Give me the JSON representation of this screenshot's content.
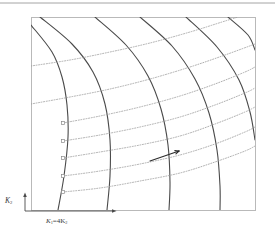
{
  "figure": {
    "type": "contour-field-diagram",
    "background": "#ffffff",
    "scan_artifact": {
      "name": "top-scan-line",
      "color": "#8a8a8a",
      "y": 3
    },
    "plot_frame": {
      "x": 31,
      "y": 17,
      "width": 224,
      "height": 193,
      "stroke": "#b9b9b9",
      "stroke_width": 1
    },
    "axes": {
      "origin": {
        "x": 25,
        "y": 211
      },
      "y_axis": {
        "label_main": "K",
        "label_sub": "2",
        "x": 25,
        "y_top": 196,
        "y_bottom": 211,
        "arrow": "up"
      },
      "x_axis": {
        "label_main": "K",
        "label_sub": "1",
        "label_rest": "=4K",
        "label_rest_sub": "2",
        "y": 228,
        "x_left": 25,
        "x_right": 113,
        "arrow": "right"
      }
    },
    "curve_families": [
      {
        "name": "primary-contours",
        "style": "solid",
        "color": "#4a4a4a",
        "stroke_width": 1.1,
        "count": 6,
        "description": "steep descending curves sweeping from upper-left to lower-right"
      },
      {
        "name": "trajectory-curves",
        "style": "dotted",
        "color": "#9a9a9a",
        "stroke_width": 0.8,
        "count": 5,
        "description": "light dotted curves rising gently to the right from square start markers"
      }
    ],
    "markers": {
      "name": "start-point-marker",
      "shape": "square",
      "size": 3,
      "fill": "#ffffff",
      "stroke": "#8a8a8a",
      "points": [
        {
          "x": 63,
          "y": 123
        },
        {
          "x": 63,
          "y": 141
        },
        {
          "x": 63,
          "y": 158
        },
        {
          "x": 63,
          "y": 176
        },
        {
          "x": 63,
          "y": 192
        }
      ]
    },
    "annotation_arrow": {
      "name": "direction-arrow",
      "x1": 150,
      "y1": 161,
      "x2": 179,
      "y2": 151,
      "color": "#2b2b2b",
      "stroke_width": 1.1
    }
  },
  "chart_data": {
    "type": "line",
    "title": "",
    "xlabel": "K1 = 4K2",
    "ylabel": "K2",
    "grid": false,
    "legend": null,
    "axis_note": "unlabeled axes; arrows indicate increasing direction",
    "series": [
      {
        "name": "contour-1",
        "style": "solid",
        "color": "#4a4a4a",
        "points": [
          [
            31,
            25
          ],
          [
            52,
            52
          ],
          [
            62,
            77
          ],
          [
            67,
            105
          ],
          [
            68,
            137
          ],
          [
            64,
            176
          ],
          [
            58,
            210
          ]
        ]
      },
      {
        "name": "contour-2",
        "style": "solid",
        "color": "#4a4a4a",
        "points": [
          [
            40,
            17
          ],
          [
            72,
            44
          ],
          [
            93,
            72
          ],
          [
            105,
            104
          ],
          [
            110,
            140
          ],
          [
            110,
            176
          ],
          [
            107,
            210
          ]
        ]
      },
      {
        "name": "contour-3",
        "style": "solid",
        "color": "#4a4a4a",
        "points": [
          [
            95,
            17
          ],
          [
            126,
            45
          ],
          [
            148,
            76
          ],
          [
            161,
            109
          ],
          [
            168,
            145
          ],
          [
            170,
            182
          ],
          [
            169,
            210
          ]
        ]
      },
      {
        "name": "contour-4",
        "style": "solid",
        "color": "#4a4a4a",
        "points": [
          [
            140,
            17
          ],
          [
            172,
            46
          ],
          [
            195,
            79
          ],
          [
            209,
            113
          ],
          [
            217,
            150
          ],
          [
            220,
            186
          ],
          [
            220,
            210
          ]
        ]
      },
      {
        "name": "contour-5",
        "style": "solid",
        "color": "#4a4a4a",
        "points": [
          [
            186,
            17
          ],
          [
            217,
            47
          ],
          [
            239,
            80
          ],
          [
            250,
            112
          ],
          [
            255,
            140
          ]
        ]
      },
      {
        "name": "contour-6",
        "style": "solid",
        "color": "#4a4a4a",
        "points": [
          [
            228,
            17
          ],
          [
            248,
            35
          ],
          [
            255,
            50
          ]
        ]
      },
      {
        "name": "trajectory-1",
        "style": "dotted",
        "color": "#9a9a9a",
        "points": [
          [
            63,
            123
          ],
          [
            100,
            116
          ],
          [
            140,
            107
          ],
          [
            180,
            96
          ],
          [
            215,
            84
          ],
          [
            245,
            72
          ],
          [
            255,
            67
          ]
        ]
      },
      {
        "name": "trajectory-2",
        "style": "dotted",
        "color": "#9a9a9a",
        "points": [
          [
            63,
            141
          ],
          [
            100,
            135
          ],
          [
            140,
            127
          ],
          [
            180,
            117
          ],
          [
            215,
            105
          ],
          [
            245,
            93
          ],
          [
            255,
            88
          ]
        ]
      },
      {
        "name": "trajectory-3",
        "style": "dotted",
        "color": "#9a9a9a",
        "points": [
          [
            63,
            158
          ],
          [
            100,
            152
          ],
          [
            140,
            145
          ],
          [
            180,
            136
          ],
          [
            215,
            124
          ],
          [
            245,
            112
          ],
          [
            255,
            107
          ]
        ]
      },
      {
        "name": "trajectory-4",
        "style": "dotted",
        "color": "#9a9a9a",
        "points": [
          [
            63,
            176
          ],
          [
            100,
            171
          ],
          [
            140,
            164
          ],
          [
            180,
            155
          ],
          [
            215,
            144
          ],
          [
            245,
            132
          ],
          [
            255,
            127
          ]
        ]
      },
      {
        "name": "trajectory-5",
        "style": "dotted",
        "color": "#9a9a9a",
        "points": [
          [
            63,
            192
          ],
          [
            100,
            188
          ],
          [
            140,
            181
          ],
          [
            180,
            173
          ],
          [
            215,
            162
          ],
          [
            245,
            151
          ],
          [
            255,
            146
          ]
        ]
      },
      {
        "name": "trajectory-upper-1",
        "style": "dotted",
        "color": "#9a9a9a",
        "points": [
          [
            31,
            104
          ],
          [
            70,
            97
          ],
          [
            110,
            89
          ],
          [
            150,
            79
          ],
          [
            190,
            67
          ],
          [
            225,
            55
          ],
          [
            255,
            44
          ]
        ]
      },
      {
        "name": "trajectory-upper-2",
        "style": "dotted",
        "color": "#9a9a9a",
        "points": [
          [
            31,
            66
          ],
          [
            70,
            60
          ],
          [
            110,
            52
          ],
          [
            150,
            43
          ],
          [
            190,
            32
          ],
          [
            222,
            22
          ],
          [
            238,
            17
          ]
        ]
      }
    ]
  }
}
